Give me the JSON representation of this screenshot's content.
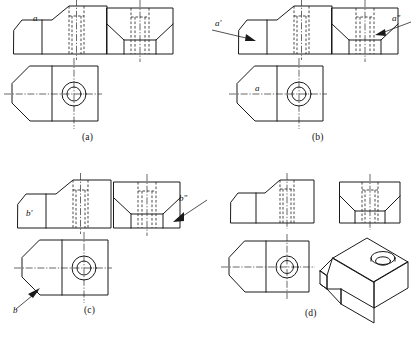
{
  "figure": {
    "type": "orthographic-projection-exercise",
    "panel_count": 4
  },
  "panels": [
    {
      "id": "a",
      "caption": "(a)",
      "views": [
        "front-view",
        "side-view",
        "top-view"
      ],
      "labels": [
        {
          "text": "a",
          "view": "front-view",
          "has_leader": false
        }
      ]
    },
    {
      "id": "b",
      "caption": "(b)",
      "views": [
        "front-view",
        "side-view",
        "top-view"
      ],
      "labels": [
        {
          "text": "a′",
          "view": "front-view",
          "has_leader": true
        },
        {
          "text": "a″",
          "view": "side-view",
          "has_leader": true
        },
        {
          "text": "a",
          "view": "top-view",
          "has_leader": false
        }
      ]
    },
    {
      "id": "c",
      "caption": "(c)",
      "views": [
        "front-view",
        "side-view",
        "top-view"
      ],
      "labels": [
        {
          "text": "b′",
          "view": "front-view",
          "has_leader": false
        },
        {
          "text": "b″",
          "view": "side-view",
          "has_leader": true
        },
        {
          "text": "b",
          "view": "top-view",
          "has_leader": true
        }
      ]
    },
    {
      "id": "d",
      "caption": "(d)",
      "views": [
        "front-view",
        "side-view",
        "top-view",
        "isometric-view"
      ],
      "labels": []
    }
  ],
  "captions": {
    "a": "(a)",
    "b": "(b)",
    "c": "(c)",
    "d": "(d)"
  },
  "marks": {
    "a_plain": "a",
    "a_prime": "a′",
    "a_double_prime": "a″",
    "b_plain": "b",
    "b_prime": "b′",
    "b_double_prime": "b″"
  },
  "colors": {
    "line": "#1a1a1a",
    "hidden_line": "#2a2a2a",
    "background": "#ffffff"
  }
}
